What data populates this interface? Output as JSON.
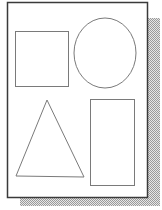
{
  "diagram": {
    "colors": {
      "background": "#ffffff",
      "page_fill": "#ffffff",
      "page_border": "#3a3a3a",
      "shape_stroke": "#7a7a7a",
      "shadow_light": "#e6e6e6",
      "shadow_dark": "#9a9a9a"
    },
    "shapes": [
      {
        "kind": "square",
        "label": "square"
      },
      {
        "kind": "ellipse",
        "label": "circle"
      },
      {
        "kind": "triangle",
        "label": "triangle"
      },
      {
        "kind": "rectangle",
        "label": "rectangle"
      }
    ],
    "has_drop_shadow": true
  }
}
